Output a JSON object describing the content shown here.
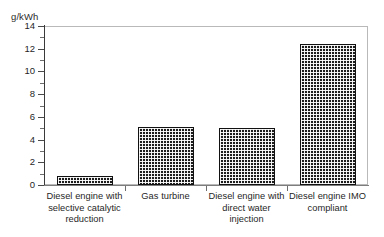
{
  "chart_data": {
    "type": "bar",
    "title": "",
    "subtitle": "",
    "xlabel": "",
    "ylabel": "g/kWh",
    "ylim": [
      0,
      14
    ],
    "ytick_step": 2,
    "yminor_step": 1,
    "grid": false,
    "legend": null,
    "categories": [
      "Diesel engine with selective catalytic reduction",
      "Gas turbine",
      "Diesel engine with direct water injection",
      "Diesel engine IMO compliant"
    ],
    "values": [
      0.8,
      5.1,
      5.0,
      12.4
    ],
    "ytick_labels": [
      "0",
      "2",
      "4",
      "6",
      "8",
      "10",
      "12",
      "14"
    ],
    "ytick_values": [
      0,
      2,
      4,
      6,
      8,
      10,
      12,
      14
    ],
    "bar_fill": "dark-checkerboard",
    "bar_outline_color": "#111111",
    "frame_color": "#b9b9b9",
    "axis_color": "#3a3a3a",
    "background_color": "#ffffff"
  },
  "category_label_lines": [
    [
      "Diesel engine with",
      "selective catalytic",
      "reduction"
    ],
    [
      "Gas turbine"
    ],
    [
      "Diesel engine with",
      "direct water",
      "injection"
    ],
    [
      "Diesel engine IMO",
      "compliant"
    ]
  ]
}
